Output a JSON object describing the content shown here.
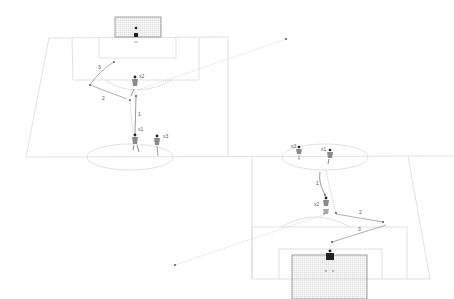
{
  "diagram": {
    "type": "soccer-drill",
    "colors": {
      "pitch_line": "#cfcfcf",
      "pass_line": "#777777",
      "dribble_line": "#999999",
      "player": "#8a8a8a",
      "goalkeeper": "#222222",
      "net": "#bbbbbb"
    },
    "top_half": {
      "labels": {
        "pass_1": "1",
        "pass_2": "2",
        "pass_3": "3",
        "player_x1": "x1",
        "player_x2": "x2",
        "player_x3": "x3"
      }
    },
    "bottom_half": {
      "labels": {
        "pass_1": "1",
        "pass_2": "2",
        "pass_3": "3",
        "player_x1": "x1",
        "player_x2": "x2",
        "player_x3": "x3"
      }
    }
  }
}
